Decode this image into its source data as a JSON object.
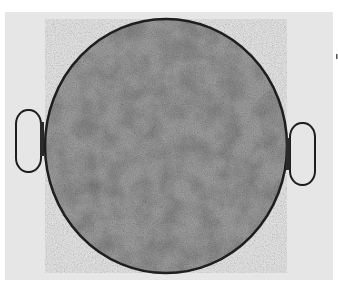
{
  "image": {
    "subject": "Round flat pan with two loop handles, viewed from above",
    "colors": {
      "background": "#ffffff",
      "backdrop": "#e6e6e6",
      "surface": "#9a9a9a",
      "rim": "#1e1e1e"
    }
  }
}
